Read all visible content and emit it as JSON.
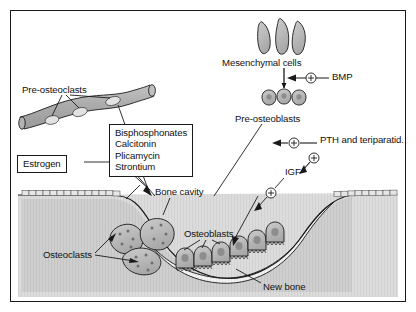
{
  "figure": {
    "frame_color": "#1a1a1a",
    "background_color": "#ffffff",
    "bone_color": "#d8d8d8",
    "cavity_color": "#c9c9c9",
    "cell_color": "#b8b8b8",
    "vessel_color": "#b0b0b0",
    "new_bone_color": "#efefef"
  },
  "labels": {
    "pre_osteoclasts": "Pre-osteoclasts",
    "estrogen": "Estrogen",
    "drug_box": "Bisphosphonates\nCalcitonin\nPlicamycin\nStrontium",
    "bone_cavity": "Bone cavity",
    "osteoclasts": "Osteoclasts",
    "osteoblasts": "Osteoblasts",
    "new_bone": "New bone",
    "mesenchymal_cells": "Mesenchymal cells",
    "bmp": "BMP",
    "pre_osteoblasts": "Pre-osteoblasts",
    "pth": "PTH and teriparatid.",
    "igf": "IGF"
  },
  "symbols": {
    "plus_bmp": "+",
    "plus_pth": "+",
    "plus_igf_upper": "+",
    "plus_igf_lower": "+"
  },
  "drug_list": [
    "Bisphosphonates",
    "Calcitonin",
    "Plicamycin",
    "Strontium"
  ],
  "counts": {
    "mesenchymal_cells": 3,
    "pre_osteoblast_cells": 3,
    "pre_osteoclast_cells_in_vessel": 3,
    "osteoclasts": 3,
    "osteoblasts": 6
  }
}
